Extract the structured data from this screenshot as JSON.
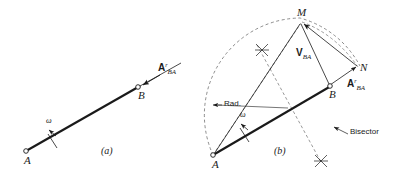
{
  "figure": {
    "background": "#ffffff",
    "line_color": "#1a1a1a",
    "dash_color": "#808080"
  },
  "panels": [
    {
      "id": "a",
      "caption": "(a)",
      "points": [
        {
          "name": "A",
          "label": "A"
        },
        {
          "name": "B",
          "label": "B"
        }
      ],
      "angular_velocity_label": "ω",
      "vectors": [
        {
          "name": "normal-acceleration",
          "base": "A",
          "superscript": "r",
          "subscript": "BA"
        }
      ]
    },
    {
      "id": "b",
      "caption": "(b)",
      "points": [
        {
          "name": "A",
          "label": "A"
        },
        {
          "name": "B",
          "label": "B"
        },
        {
          "name": "M",
          "label": "M"
        },
        {
          "name": "N",
          "label": "N"
        }
      ],
      "angular_velocity_label": "ω",
      "vectors": [
        {
          "name": "relative-velocity",
          "base": "V",
          "superscript": "",
          "subscript": "BA"
        },
        {
          "name": "normal-acceleration",
          "base": "A",
          "superscript": "r",
          "subscript": "BA"
        }
      ],
      "annotations": [
        {
          "name": "radius",
          "text": "Rad."
        },
        {
          "name": "bisector",
          "text": "Bisector"
        }
      ]
    }
  ]
}
